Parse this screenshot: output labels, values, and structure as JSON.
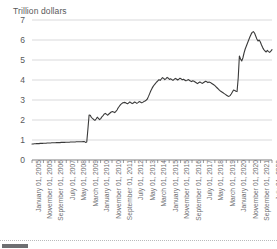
{
  "chart_data": {
    "type": "line",
    "title": "",
    "ylabel": "Trillion dollars",
    "xlabel": "",
    "ylim": [
      0,
      7
    ],
    "yticks": [
      0,
      1,
      2,
      3,
      4,
      5,
      6,
      7
    ],
    "grid": true,
    "legend": null,
    "line_color": "#3a3a3a",
    "grid_color": "#c8c9cb",
    "axis_color": "#6d6e71",
    "xtick_labels": [
      "January 01, 2005",
      "November 01, 2005",
      "September 01, 2006",
      "July 01, 2007",
      "May 01, 2008",
      "March 01, 2009",
      "January 01, 2010",
      "November 01, 2010",
      "September 01, 2011",
      "July 01, 2012",
      "May 01, 2013",
      "March 01, 2014",
      "January 01, 2015",
      "November 01, 2015",
      "September 01, 2016",
      "July 01, 2017",
      "May 01, 2018",
      "March 01, 2019",
      "January 01, 2020",
      "November 01, 2020",
      "September 01, 2021",
      "July 01, 2022"
    ],
    "x_start_label": "January 01, 2005",
    "x_end_label": "July 01, 2022",
    "x_interval_months": 10,
    "series": [
      {
        "name": "Total assets",
        "units": "Trillion dollars",
        "values": [
          0.8,
          0.8,
          0.81,
          0.81,
          0.82,
          0.82,
          0.82,
          0.83,
          0.83,
          0.83,
          0.84,
          0.84,
          0.84,
          0.85,
          0.85,
          0.85,
          0.85,
          0.86,
          0.86,
          0.86,
          0.86,
          0.87,
          0.87,
          0.87,
          0.87,
          0.88,
          0.88,
          0.88,
          0.88,
          0.89,
          0.89,
          0.89,
          0.89,
          0.9,
          0.9,
          0.9,
          0.9,
          0.9,
          0.91,
          0.91,
          0.91,
          0.91,
          0.91,
          0.91,
          0.92,
          0.92,
          0.88,
          0.9,
          1.55,
          2.25,
          2.24,
          2.12,
          2.08,
          2.02,
          1.98,
          2.05,
          2.14,
          2.08,
          2.02,
          2.07,
          2.16,
          2.22,
          2.3,
          2.33,
          2.28,
          2.24,
          2.3,
          2.35,
          2.4,
          2.42,
          2.4,
          2.37,
          2.43,
          2.5,
          2.61,
          2.69,
          2.77,
          2.82,
          2.86,
          2.88,
          2.87,
          2.84,
          2.81,
          2.86,
          2.91,
          2.86,
          2.82,
          2.85,
          2.9,
          2.87,
          2.83,
          2.87,
          2.92,
          2.9,
          2.86,
          2.88,
          2.92,
          2.95,
          2.99,
          3.05,
          3.18,
          3.32,
          3.46,
          3.58,
          3.68,
          3.76,
          3.83,
          3.9,
          3.96,
          4.02,
          3.98,
          4.05,
          4.12,
          4.08,
          4.02,
          4.07,
          4.13,
          4.09,
          4.03,
          4.06,
          4.02,
          3.98,
          4.03,
          4.08,
          4.05,
          4.0,
          4.04,
          4.09,
          4.06,
          4.01,
          4.04,
          4.0,
          3.96,
          3.98,
          4.02,
          3.99,
          3.95,
          3.92,
          3.96,
          3.94,
          3.9,
          3.86,
          3.82,
          3.86,
          3.9,
          3.87,
          3.83,
          3.86,
          3.9,
          3.94,
          3.91,
          3.87,
          3.9,
          3.88,
          3.84,
          3.8,
          3.76,
          3.72,
          3.66,
          3.6,
          3.54,
          3.48,
          3.44,
          3.4,
          3.36,
          3.32,
          3.28,
          3.24,
          3.2,
          3.18,
          3.22,
          3.3,
          3.4,
          3.5,
          3.48,
          3.44,
          3.42,
          4.1,
          5.2,
          5.05,
          4.95,
          5.1,
          5.35,
          5.55,
          5.7,
          5.85,
          6.0,
          6.15,
          6.28,
          6.38,
          6.42,
          6.35,
          6.2,
          6.05,
          5.95,
          6.0,
          5.9,
          5.75,
          5.62,
          5.52,
          5.45,
          5.4,
          5.48,
          5.42,
          5.38,
          5.44,
          5.52
        ]
      }
    ]
  }
}
